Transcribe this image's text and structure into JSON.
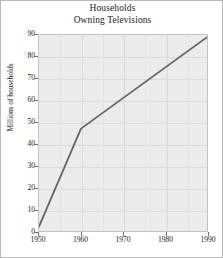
{
  "chart_data": {
    "type": "line",
    "title": "Households Owning Televisions",
    "title_lines": [
      "Households",
      "Owning Televisions"
    ],
    "xlabel": "",
    "ylabel": "Millions of households",
    "x": [
      1950,
      1960,
      1970,
      1980,
      1990
    ],
    "values": [
      2,
      47,
      61,
      76,
      89
    ],
    "series": [
      {
        "name": "Millions of households",
        "points": [
          {
            "x": 1950,
            "y": 2
          },
          {
            "x": 1960,
            "y": 47
          },
          {
            "x": 1990,
            "y": 89
          }
        ],
        "color": "#666666"
      }
    ],
    "xlim": [
      1950,
      1990
    ],
    "ylim": [
      0,
      90
    ],
    "xticks": [
      1950,
      1960,
      1970,
      1980,
      1990
    ],
    "xtick_labels": [
      "1950",
      "1960",
      "1970",
      "1980",
      "1990"
    ],
    "yticks": [
      0,
      10,
      20,
      30,
      40,
      50,
      60,
      70,
      80,
      90
    ],
    "ytick_labels": [
      "0",
      "10",
      "20",
      "30",
      "40",
      "50",
      "60",
      "70",
      "80",
      "90"
    ],
    "grid": true,
    "legend": false,
    "plot_background": "#ececec",
    "grid_color": "#d9d9d9",
    "line_color": "#666666",
    "frame_color": "#b9b9b9"
  }
}
